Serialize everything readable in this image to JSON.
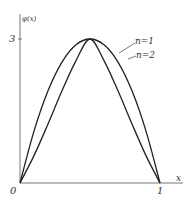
{
  "chart_data": {
    "type": "line",
    "title": "",
    "xlabel": "x",
    "ylabel": "φ(x)",
    "xlim": [
      0,
      1
    ],
    "ylim": [
      0,
      3
    ],
    "x_ticks": [
      "0",
      "1"
    ],
    "y_ticks": [
      "3"
    ],
    "grid": false,
    "legend_position": "annotations-right",
    "series": [
      {
        "name": "n=1",
        "x": [
          0,
          0.1,
          0.2,
          0.3,
          0.4,
          0.5,
          0.6,
          0.7,
          0.8,
          0.9,
          1
        ],
        "values": [
          0,
          1.08,
          1.92,
          2.52,
          2.88,
          3.0,
          2.88,
          2.52,
          1.92,
          1.08,
          0
        ]
      },
      {
        "name": "n=2",
        "x": [
          0,
          0.1,
          0.2,
          0.3,
          0.4,
          0.5,
          0.6,
          0.7,
          0.8,
          0.9,
          1
        ],
        "values": [
          0,
          0.57,
          1.23,
          1.92,
          2.55,
          3.0,
          2.55,
          1.92,
          1.23,
          0.57,
          0
        ]
      }
    ],
    "annotations": [
      "n=1",
      "n=2"
    ]
  },
  "labels": {
    "ylabel": "φ(x)",
    "ytick_3": "3",
    "origin": "0",
    "xtick_1": "1",
    "xlabel": "x",
    "n1": "n=1",
    "n2": "n=2"
  }
}
